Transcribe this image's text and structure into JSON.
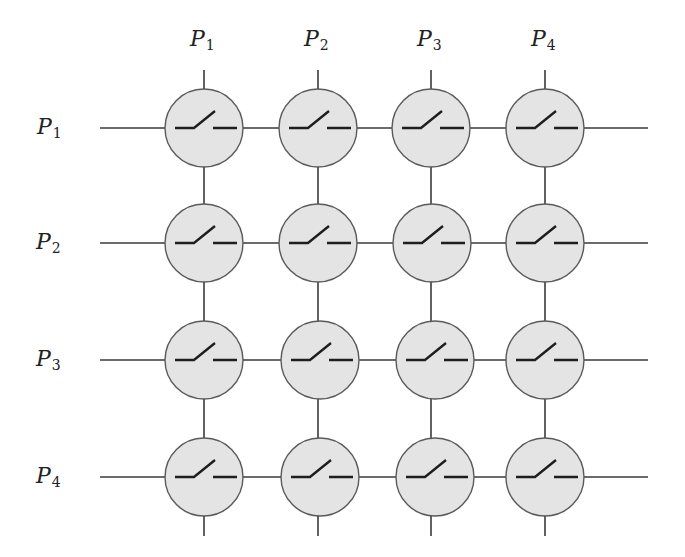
{
  "diagram": {
    "type": "crossbar-switch",
    "column_labels": [
      {
        "base": "P",
        "sub": "1"
      },
      {
        "base": "P",
        "sub": "2"
      },
      {
        "base": "P",
        "sub": "3"
      },
      {
        "base": "P",
        "sub": "4"
      }
    ],
    "row_labels": [
      {
        "base": "P",
        "sub": "1"
      },
      {
        "base": "P",
        "sub": "2"
      },
      {
        "base": "P",
        "sub": "3"
      },
      {
        "base": "P",
        "sub": "4"
      }
    ],
    "switch_state": "open",
    "colors": {
      "node_fill": "#e4e4e4",
      "node_stroke": "#5a5a5a",
      "wire": "#3a3a3a",
      "switch": "#1e1e1e"
    }
  }
}
